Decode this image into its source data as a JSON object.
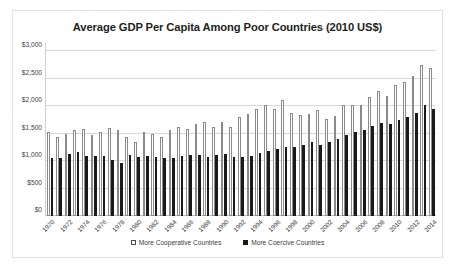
{
  "chart_data": {
    "type": "bar",
    "title": "Average GDP Per Capita Among Poor Countries (2010 US$)",
    "xlabel": "",
    "ylabel": "",
    "ylim": [
      0,
      3000
    ],
    "yticks": [
      3000,
      2500,
      2000,
      1500,
      1000,
      500,
      0
    ],
    "ytick_labels": [
      "$3,000",
      "$2,500",
      "$2,000",
      "$1,500",
      "$1,000",
      "$500",
      "$0"
    ],
    "grid": true,
    "legend_position": "bottom",
    "categories": [
      "1970",
      "1971",
      "1972",
      "1973",
      "1974",
      "1975",
      "1976",
      "1977",
      "1978",
      "1979",
      "1980",
      "1981",
      "1982",
      "1983",
      "1984",
      "1985",
      "1986",
      "1987",
      "1988",
      "1989",
      "1990",
      "1991",
      "1992",
      "1993",
      "1994",
      "1995",
      "1996",
      "1997",
      "1998",
      "1999",
      "2000",
      "2001",
      "2002",
      "2003",
      "2004",
      "2005",
      "2006",
      "2007",
      "2008",
      "2009",
      "2010",
      "2011",
      "2012",
      "2013",
      "2014"
    ],
    "xtick_labels": [
      "1970",
      "1972",
      "1974",
      "1976",
      "1978",
      "1980",
      "1982",
      "1984",
      "1986",
      "1988",
      "1990",
      "1992",
      "1994",
      "1996",
      "1998",
      "2000",
      "2002",
      "2004",
      "2006",
      "2008",
      "2010",
      "2012",
      "2014"
    ],
    "series": [
      {
        "name": "More Cooperative Countries",
        "color": "#ffffff",
        "edge_color": "#8a8a8a",
        "values": [
          1530,
          1440,
          1500,
          1560,
          1590,
          1480,
          1530,
          1600,
          1560,
          1440,
          1350,
          1530,
          1500,
          1440,
          1560,
          1620,
          1590,
          1680,
          1710,
          1620,
          1710,
          1620,
          1800,
          1860,
          1950,
          2020,
          1950,
          2110,
          1880,
          1830,
          1860,
          1920,
          1770,
          1820,
          2020,
          2010,
          2020,
          2170,
          2280,
          2180,
          2380,
          2440,
          2550,
          2740,
          2700
        ]
      },
      {
        "name": "More Coercive Countries",
        "color": "#1a1a1a",
        "values": [
          1050,
          1050,
          1130,
          1170,
          1100,
          1090,
          1100,
          1020,
          960,
          1110,
          1070,
          1090,
          1070,
          1050,
          1050,
          1100,
          1110,
          1110,
          1080,
          1110,
          1120,
          1080,
          1070,
          1090,
          1140,
          1180,
          1210,
          1250,
          1260,
          1290,
          1340,
          1300,
          1350,
          1400,
          1470,
          1530,
          1560,
          1640,
          1690,
          1670,
          1740,
          1800,
          1880,
          2020,
          1950
        ]
      }
    ]
  },
  "legend": {
    "cooperative_label": "More Cooperative Countries",
    "coercive_label": "More Coercive Countries"
  }
}
